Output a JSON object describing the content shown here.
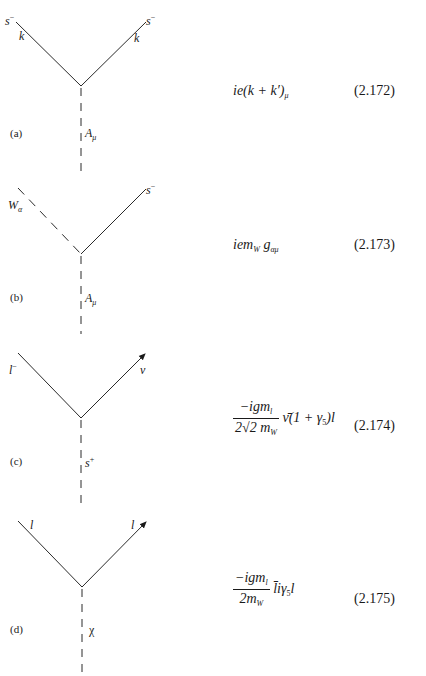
{
  "diagrams": [
    {
      "id": "a",
      "tag": "(a)",
      "left_label": {
        "base": "s",
        "sup": "−"
      },
      "right_label": {
        "base": "s",
        "sup": "−"
      },
      "left_momentum": "k",
      "right_momentum": "k",
      "bottom_label": {
        "base": "A",
        "sub": "μ"
      },
      "equation": {
        "text": "ie(k + k′)",
        "sub": "μ"
      },
      "equation_number": "(2.172)"
    },
    {
      "id": "b",
      "tag": "(b)",
      "left_label": {
        "base": "W",
        "sub": "α"
      },
      "right_label": {
        "base": "s",
        "sup": "−"
      },
      "bottom_label": {
        "base": "A",
        "sub": "μ"
      },
      "equation": {
        "pre": "iem",
        "sub1": "W",
        "mid": " g",
        "sub2": "αμ"
      },
      "equation_number": "(2.173)"
    },
    {
      "id": "c",
      "tag": "(c)",
      "left_label": {
        "base": "l",
        "sup": "−"
      },
      "right_label": {
        "base": "ν"
      },
      "bottom_label": {
        "base": "s",
        "sup": "+"
      },
      "equation": {
        "numerator": {
          "pre": "−igm",
          "sub": "l"
        },
        "denominator": {
          "pre": "2√2 m",
          "sub": "W"
        },
        "rest_pre": " ν̄(1 + γ",
        "rest_sub": "5",
        "rest_post": ")l"
      },
      "equation_number": "(2.174)"
    },
    {
      "id": "d",
      "tag": "(d)",
      "left_label": {
        "base": "l"
      },
      "right_label": {
        "base": "l"
      },
      "bottom_label": {
        "base": "χ"
      },
      "equation": {
        "numerator": {
          "pre": "−igm",
          "sub": "l"
        },
        "denominator": {
          "pre": "2m",
          "sub": "W"
        },
        "rest_pre": " l̄iγ",
        "rest_sub": "5",
        "rest_post": "l"
      },
      "equation_number": "(2.175)"
    }
  ]
}
